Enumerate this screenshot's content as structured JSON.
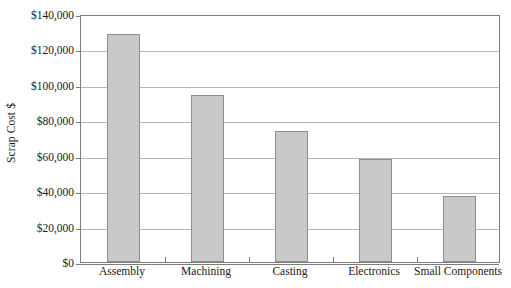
{
  "chart_data": {
    "type": "bar",
    "title": "",
    "subtitle": "",
    "xlabel": "",
    "ylabel": "Scrap Cost $",
    "categories": [
      "Assembly",
      "Machining",
      "Casting",
      "Electronics",
      "Small Components"
    ],
    "values": [
      128500,
      94500,
      74000,
      58000,
      37500
    ],
    "series": [
      {
        "name": "Scrap Cost",
        "values": [
          128500,
          94500,
          74000,
          58000,
          37500
        ]
      }
    ],
    "ylim": [
      0,
      140000
    ],
    "ytick_values": [
      0,
      20000,
      40000,
      60000,
      80000,
      100000,
      120000,
      140000
    ],
    "ytick_labels": [
      "$0",
      "$20,000",
      "$40,000",
      "$60,000",
      "$80,000",
      "$100,000",
      "$120,000",
      "$140,000"
    ],
    "grid": true,
    "grid_axis": "y",
    "legend": false,
    "legend_position": "none",
    "annotations": [],
    "colors": {
      "bar_fill": "#c9c9c9",
      "bar_border": "#8e8e8e",
      "gridline": "#b5b5b5",
      "axis": "#7d7d7d",
      "text": "#1a1a1a",
      "background": "#ffffff"
    }
  }
}
